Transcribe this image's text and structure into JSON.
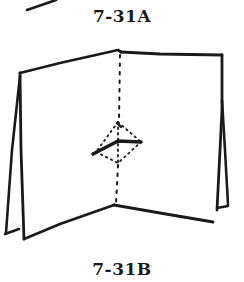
{
  "figure": {
    "labels": {
      "a": "7-31A",
      "b": "7-31B"
    },
    "colors": {
      "ink": "#1a1a1a",
      "background": "#ffffff"
    }
  }
}
